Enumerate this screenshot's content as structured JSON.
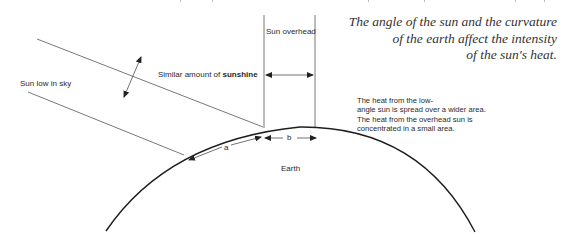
{
  "caption": {
    "lines": [
      "The angle of the sun and the curvature",
      "of the earth affect the intensity",
      "of the sun's heat."
    ]
  },
  "labels": {
    "sun_low": "Sun low in sky",
    "sun_overhead": "Sun overhead",
    "similar_prefix": "Similar amount of ",
    "similar_bold": "sunshine",
    "earth": "Earth",
    "arc_a": "a",
    "arc_b": "b"
  },
  "note": {
    "lines": [
      "The heat from the low-",
      "angle sun is spread over a wider area.",
      "The heat from the overhead sun is",
      "concentrated in a small area."
    ]
  },
  "colors": {
    "line": "#333333",
    "earth": "#1e1e1e",
    "text": "#2a2a2a",
    "background": "#ffffff"
  }
}
